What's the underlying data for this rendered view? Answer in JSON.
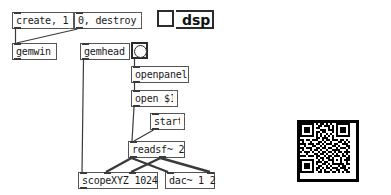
{
  "app": {
    "type": "puredata-gem-patch",
    "canvas_background": "#ffffff",
    "box_fill": "#fdfdfd",
    "box_stroke": "#555555",
    "wire_color": "#3a3a3a"
  },
  "objects": {
    "msg_create": {
      "label": "create, 1",
      "kind": "message",
      "x": 12,
      "y": 12,
      "w": 62,
      "h": 17
    },
    "msg_destroy": {
      "label": "0, destroy",
      "kind": "message",
      "x": 74,
      "y": 12,
      "w": 68,
      "h": 17
    },
    "obj_gemwin": {
      "label": "gemwin",
      "kind": "object",
      "x": 12,
      "y": 43,
      "w": 45,
      "h": 17
    },
    "obj_gemhead": {
      "label": "gemhead",
      "kind": "object",
      "x": 80,
      "y": 43,
      "w": 50,
      "h": 17
    },
    "bng_openfile": {
      "label": "bang",
      "kind": "bang",
      "x": 131,
      "y": 42,
      "w": 17,
      "h": 17
    },
    "obj_openpanel": {
      "label": "openpanel",
      "kind": "object",
      "x": 131,
      "y": 66,
      "w": 58,
      "h": 17
    },
    "msg_open": {
      "label": "open $1",
      "kind": "message",
      "x": 131,
      "y": 90,
      "w": 47,
      "h": 17
    },
    "msg_start": {
      "label": "start",
      "kind": "message",
      "x": 150,
      "y": 113,
      "w": 35,
      "h": 17
    },
    "obj_readsf": {
      "label": "readsf~ 2",
      "kind": "object",
      "x": 128,
      "y": 141,
      "w": 57,
      "h": 17
    },
    "obj_scope": {
      "label": "scopeXYZ 1024",
      "kind": "object",
      "x": 78,
      "y": 172,
      "w": 80,
      "h": 17
    },
    "obj_dac": {
      "label": "dac~ 1 2",
      "kind": "object",
      "x": 165,
      "y": 172,
      "w": 50,
      "h": 17
    },
    "tgl_dsp": {
      "label": "dsp-toggle",
      "kind": "toggle",
      "checked": false,
      "x": 157,
      "y": 10,
      "w": 19,
      "h": 19
    },
    "lbl_dsp": {
      "label": "dsp",
      "kind": "label",
      "x": 176,
      "y": 10,
      "w": 38,
      "h": 19
    },
    "qr_code": {
      "label": "qr-code",
      "kind": "image",
      "x": 297,
      "y": 120,
      "w": 62,
      "h": 62
    }
  },
  "connections": [
    {
      "from": "msg_create",
      "from_outlet": 0,
      "to": "obj_gemwin",
      "to_inlet": 0,
      "signal": false
    },
    {
      "from": "msg_destroy",
      "from_outlet": 0,
      "to": "obj_gemwin",
      "to_inlet": 0,
      "signal": false
    },
    {
      "from": "bng_openfile",
      "from_outlet": 0,
      "to": "obj_openpanel",
      "to_inlet": 0,
      "signal": false
    },
    {
      "from": "obj_openpanel",
      "from_outlet": 0,
      "to": "msg_open",
      "to_inlet": 0,
      "signal": false
    },
    {
      "from": "msg_open",
      "from_outlet": 0,
      "to": "obj_readsf",
      "to_inlet": 0,
      "signal": false
    },
    {
      "from": "msg_start",
      "from_outlet": 0,
      "to": "obj_readsf",
      "to_inlet": 0,
      "signal": false
    },
    {
      "from": "obj_gemhead",
      "from_outlet": 0,
      "to": "obj_scope",
      "to_inlet": 0,
      "signal": false
    },
    {
      "from": "obj_readsf",
      "from_outlet": 0,
      "to": "obj_scope",
      "to_inlet": 1,
      "signal": true
    },
    {
      "from": "obj_readsf",
      "from_outlet": 1,
      "to": "obj_scope",
      "to_inlet": 2,
      "signal": true
    },
    {
      "from": "obj_readsf",
      "from_outlet": 0,
      "to": "obj_dac",
      "to_inlet": 0,
      "signal": true
    },
    {
      "from": "obj_readsf",
      "from_outlet": 1,
      "to": "obj_dac",
      "to_inlet": 1,
      "signal": true
    }
  ],
  "qr": {
    "modules": 25,
    "bits": [
      "1111111010110101001111111",
      "1000001001101110101000001",
      "1011101011000010101011101",
      "1011101000111011101011101",
      "1011101011011000101011101",
      "1000001010100101001000001",
      "1111111010101010101111111",
      "0000000011011100100000000",
      "1101101110010110111011010",
      "0100010001101001000110101",
      "1110111011010111011001110",
      "0010001100101000110100011",
      "1101110011011011001011101",
      "0100010110100100111100010",
      "1011101001011011010110111",
      "0001000110110100101001010",
      "1110111011001011011101101",
      "0000000010110110100010011",
      "1111111001010011101010111",
      "1000001011101100100010010",
      "1011101010011010111111011",
      "1011101001100101000101100",
      "1011101011010110111011101",
      "1000001010101001001100110",
      "1111111001101110110101011"
    ]
  }
}
